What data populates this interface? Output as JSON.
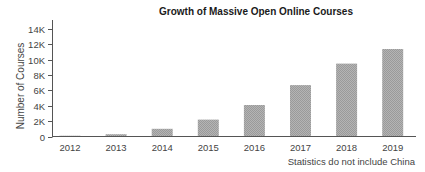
{
  "chart_data": {
    "type": "bar",
    "title": "Growth of Massive Open Online Courses",
    "xlabel": "",
    "ylabel": "Number of Courses",
    "categories": [
      "2012",
      "2013",
      "2014",
      "2015",
      "2016",
      "2017",
      "2018",
      "2019"
    ],
    "values": [
      100,
      300,
      1000,
      2200,
      4100,
      6700,
      9500,
      11400
    ],
    "ylim": [
      0,
      14000
    ],
    "yticks": [
      0,
      2000,
      4000,
      6000,
      8000,
      10000,
      12000,
      14000
    ],
    "ytick_labels": [
      "0",
      "2K",
      "4K",
      "6K",
      "8K",
      "10K",
      "12K",
      "14K"
    ],
    "grid": false,
    "legend": null,
    "annotations": [
      "Statistics do not include China"
    ],
    "bar_color": "#a9a9a9",
    "bar_pattern": "fine dotted hatch"
  }
}
